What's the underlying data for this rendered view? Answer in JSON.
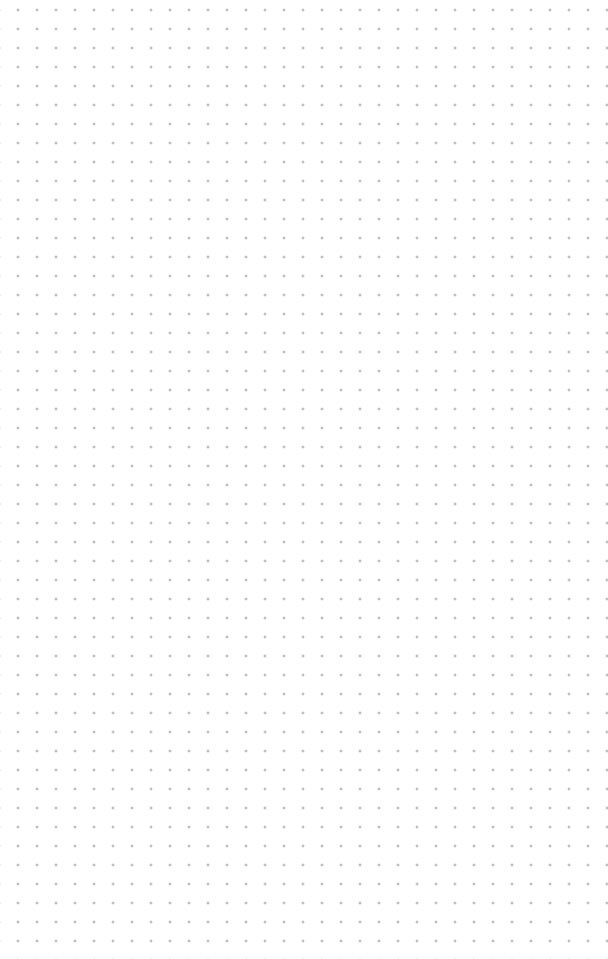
{
  "canvas": {
    "type": "dot-grid",
    "background_color": "#ffffff",
    "dot_color": "#9a9a9a",
    "dot_spacing_px": 19,
    "columns": 30,
    "rows": 48
  }
}
